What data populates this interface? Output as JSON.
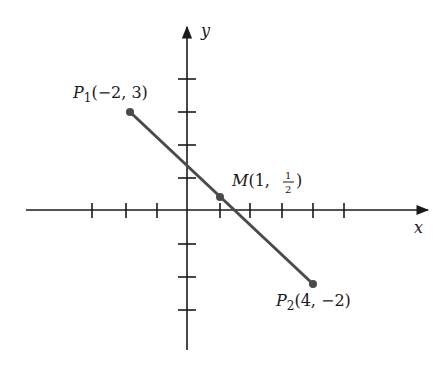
{
  "diagram": {
    "title": "",
    "axes": {
      "x_label": "x",
      "y_label": "y",
      "origin_px": [
        187,
        210
      ],
      "x_unit_px": 31.5,
      "y_unit_px": 33,
      "x_ticks": [
        -5,
        -4,
        -3,
        -2,
        -1,
        1,
        2,
        3,
        4,
        5
      ],
      "y_ticks": [
        -4,
        -3,
        -2,
        -1,
        1,
        2,
        3,
        4
      ]
    },
    "points": [
      {
        "id": "P1",
        "name": "P",
        "sub": "1",
        "coords": "(−2, 3)",
        "x": -2,
        "y": 3
      },
      {
        "id": "M",
        "name": "M",
        "coords_prefix": "(1, ",
        "frac_num": "1",
        "frac_den": "2",
        "coords_suffix": ")",
        "x": 1,
        "y": 0.5
      },
      {
        "id": "P2",
        "name": "P",
        "sub": "2",
        "coords": "(4, −2)",
        "x": 4,
        "y": -2
      }
    ],
    "segment": {
      "from": "P1",
      "to": "P2"
    },
    "colors": {
      "axis": "#1a1a1a",
      "segment": "#4a4a4a",
      "point": "#4a4a4a",
      "text": "#1a1a1a"
    }
  }
}
